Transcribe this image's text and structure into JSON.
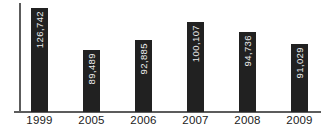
{
  "chart_data": {
    "type": "bar",
    "title": "",
    "xlabel": "",
    "ylabel": "",
    "categories": [
      "1999",
      "2005",
      "2006",
      "2007",
      "2008",
      "2009"
    ],
    "values": [
      126742,
      89489,
      92885,
      100107,
      94736,
      91029
    ],
    "value_labels": [
      "126,742",
      "89,489",
      "92,885",
      "100,107",
      "94,736",
      "91,029"
    ],
    "value_label_orientation": "rotated-90-ccw-inside-bar-top",
    "grid": "off",
    "legend": "none",
    "layout": {
      "bar_width_px": 17,
      "bar_left_px": [
        31,
        83,
        135,
        187,
        239,
        291
      ],
      "bar_height_px": [
        104,
        62,
        72,
        90,
        80,
        68
      ],
      "baseline_y_px": 112,
      "bar_color": "#212121",
      "value_label_color": "#ececec",
      "axis_color": "#5c5c5c",
      "tick_label_color": "#1b1b1b",
      "background_color": "#ffffff"
    }
  }
}
